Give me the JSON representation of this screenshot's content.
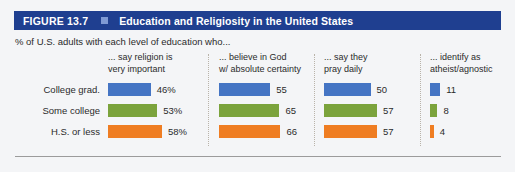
{
  "figure": {
    "number": "FIGURE 13.7",
    "title": "Education and Religiosity in the United States",
    "subtitle": "% of U.S. adults with each level of education who...",
    "accent_color": "#1f3f90",
    "square_color": "#7f9ad4"
  },
  "chart_data": {
    "type": "bar",
    "title": "Education and Religiosity in the United States",
    "subtitle": "% of U.S. adults with each level of education who...",
    "orientation": "horizontal",
    "grid": false,
    "legend": "none",
    "categories": [
      "College grad.",
      "Some college",
      "H.S. or less"
    ],
    "category_colors": [
      "#4575c4",
      "#7ba33c",
      "#ef7d22"
    ],
    "series": [
      {
        "name": "... say religion is very important",
        "header_line1": "... say religion is",
        "header_line2": "very important",
        "values": [
          46,
          53,
          58
        ],
        "labels": [
          "46%",
          "53%",
          "58%"
        ]
      },
      {
        "name": "... believe in God w/ absolute certainty",
        "header_line1": "... believe in God",
        "header_line2": "w/ absolute certainty",
        "values": [
          55,
          65,
          66
        ],
        "labels": [
          "55",
          "65",
          "66"
        ]
      },
      {
        "name": "... say they pray daily",
        "header_line1": "... say they",
        "header_line2": "pray daily",
        "values": [
          50,
          57,
          57
        ],
        "labels": [
          "50",
          "57",
          "57"
        ]
      },
      {
        "name": "... identify as atheist/agnostic",
        "header_line1": "... identify as",
        "header_line2": "atheist/agnostic",
        "values": [
          11,
          8,
          4
        ],
        "labels": [
          "11",
          "8",
          "4"
        ]
      }
    ],
    "ylabel": "",
    "xlabel": "",
    "xlim": [
      0,
      70
    ]
  }
}
